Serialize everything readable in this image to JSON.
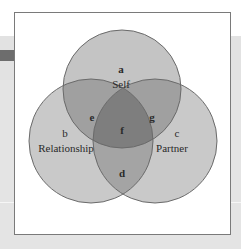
{
  "diagram": {
    "type": "venn-3",
    "colors": {
      "circle_fill": "#c6c6c6",
      "pair_overlap": "#9a9a9a",
      "triple_overlap": "#7a7a7a",
      "stroke": "#6a6a6a",
      "frame_border": "#7a7a7a",
      "background": "#e4e4e4"
    },
    "sets": [
      {
        "id": "a",
        "letter": "a",
        "name": "Self"
      },
      {
        "id": "b",
        "letter": "b",
        "name": "Relationship"
      },
      {
        "id": "c",
        "letter": "c",
        "name": "Partner"
      }
    ],
    "regions": [
      {
        "id": "e",
        "letter": "e",
        "between": [
          "Self",
          "Relationship"
        ]
      },
      {
        "id": "g",
        "letter": "g",
        "between": [
          "Self",
          "Partner"
        ]
      },
      {
        "id": "d",
        "letter": "d",
        "between": [
          "Relationship",
          "Partner"
        ]
      },
      {
        "id": "f",
        "letter": "f",
        "between": [
          "Self",
          "Relationship",
          "Partner"
        ]
      }
    ]
  }
}
